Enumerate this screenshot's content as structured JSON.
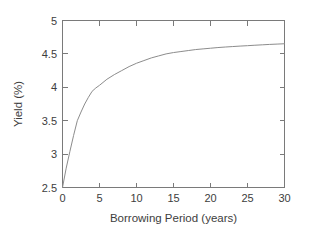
{
  "chart_data": {
    "type": "line",
    "title": "",
    "xlabel": "Borrowing Period (years)",
    "ylabel": "Yield (%)",
    "xlim": [
      0,
      30
    ],
    "ylim": [
      2.5,
      5
    ],
    "xticks": [
      0,
      5,
      10,
      15,
      20,
      25,
      30
    ],
    "xtick_labels": [
      "0",
      "5",
      "10",
      "15",
      "20",
      "25",
      "30"
    ],
    "yticks": [
      2.5,
      3,
      3.5,
      4,
      4.5,
      5
    ],
    "ytick_labels": [
      "2.5",
      "3",
      "3.5",
      "4",
      "4.5",
      "5"
    ],
    "grid": false,
    "legend": null,
    "series": [
      {
        "name": "Yield curve",
        "color": "#8c8c8c",
        "x": [
          0,
          0.5,
          1,
          1.5,
          2,
          2.5,
          3,
          3.5,
          4,
          4.5,
          5,
          6,
          7,
          8,
          9,
          10,
          11,
          12,
          13,
          14,
          15,
          16,
          17,
          18,
          19,
          20,
          21,
          22,
          23,
          24,
          25,
          26,
          27,
          28,
          29,
          30
        ],
        "y": [
          2.5,
          2.79,
          3.04,
          3.28,
          3.5,
          3.63,
          3.75,
          3.85,
          3.94,
          3.99,
          4.03,
          4.12,
          4.19,
          4.25,
          4.31,
          4.36,
          4.4,
          4.44,
          4.47,
          4.5,
          4.52,
          4.535,
          4.55,
          4.565,
          4.575,
          4.585,
          4.595,
          4.603,
          4.61,
          4.617,
          4.623,
          4.63,
          4.636,
          4.642,
          4.647,
          4.652
        ]
      }
    ]
  },
  "axes": {
    "x_title": "Borrowing Period (years)",
    "y_title": "Yield (%)"
  }
}
